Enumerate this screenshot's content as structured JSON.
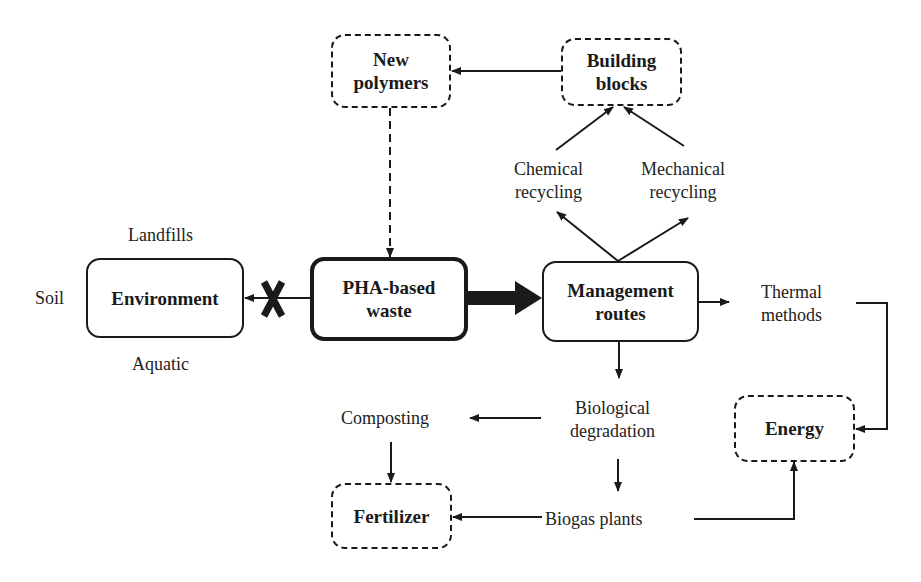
{
  "diagram": {
    "nodes": {
      "new_polymers": {
        "label": "New polymers",
        "line1": "New",
        "line2": "polymers",
        "style": "dashed"
      },
      "building_blocks": {
        "label": "Building blocks",
        "line1": "Building",
        "line2": "blocks",
        "style": "dashed"
      },
      "environment": {
        "label": "Environment",
        "style": "solid"
      },
      "pha_waste": {
        "label": "PHA-based waste",
        "line1": "PHA-based",
        "line2": "waste",
        "style": "thick"
      },
      "management": {
        "label": "Management routes",
        "line1": "Management",
        "line2": "routes",
        "style": "solid"
      },
      "energy": {
        "label": "Energy",
        "style": "dashed"
      },
      "fertilizer": {
        "label": "Fertilizer",
        "style": "dashed"
      }
    },
    "labels": {
      "landfills": "Landfills",
      "soil": "Soil",
      "aquatic": "Aquatic",
      "chemical_recycling": {
        "line1": "Chemical",
        "line2": "recycling"
      },
      "mechanical_recycling": {
        "line1": "Mechanical",
        "line2": "recycling"
      },
      "thermal_methods": {
        "line1": "Thermal",
        "line2": "methods"
      },
      "biological_degradation": {
        "line1": "Biological",
        "line2": "degradation"
      },
      "composting": "Composting",
      "biogas_plants": "Biogas plants"
    },
    "edges": [
      {
        "from": "Building blocks",
        "to": "New polymers",
        "style": "solid"
      },
      {
        "from": "New polymers",
        "to": "PHA-based waste",
        "style": "dashed"
      },
      {
        "from": "PHA-based waste",
        "to": "Environment",
        "style": "solid",
        "blocked": true,
        "marker": "X"
      },
      {
        "from": "PHA-based waste",
        "to": "Management routes",
        "style": "thick"
      },
      {
        "from": "Management routes",
        "to": "Chemical recycling"
      },
      {
        "from": "Management routes",
        "to": "Mechanical recycling"
      },
      {
        "from": "Chemical recycling",
        "to": "Building blocks"
      },
      {
        "from": "Mechanical recycling",
        "to": "Building blocks"
      },
      {
        "from": "Management routes",
        "to": "Thermal methods"
      },
      {
        "from": "Management routes",
        "to": "Biological degradation"
      },
      {
        "from": "Thermal methods",
        "to": "Energy"
      },
      {
        "from": "Biological degradation",
        "to": "Composting"
      },
      {
        "from": "Biological degradation",
        "to": "Biogas plants"
      },
      {
        "from": "Composting",
        "to": "Fertilizer"
      },
      {
        "from": "Biogas plants",
        "to": "Fertilizer"
      },
      {
        "from": "Biogas plants",
        "to": "Energy"
      }
    ],
    "colors": {
      "ink": "#1a1a1a",
      "background": "#ffffff"
    }
  }
}
